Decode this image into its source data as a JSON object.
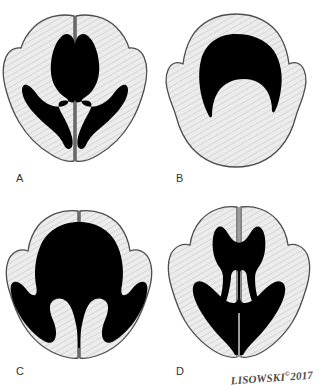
{
  "figure": {
    "background_color": "#ffffff",
    "brain_fill_color": "#e8e8e8",
    "brain_outline_color": "#4d4d4d",
    "ventricle_color": "#000000",
    "hatch_color": "#b8b8b8",
    "panel_count": 4
  },
  "panels": [
    {
      "label": "A",
      "name": "normal-ventricles",
      "description": "Normal paired lateral ventricles, butterfly configuration with frontal and occipital horns",
      "ventricle_pattern": "paired-slender-butterfly"
    },
    {
      "label": "B",
      "name": "single-crescent-ventricle",
      "description": "Single midline crescent-shaped monoventricle, absent interhemispheric fissure",
      "ventricle_pattern": "crescent-monoventricle"
    },
    {
      "label": "C",
      "name": "fused-dilated-ventricles",
      "description": "Large fused dilated ventricular cavity with partial posterior separation",
      "ventricle_pattern": "fused-dilated"
    },
    {
      "label": "D",
      "name": "dilated-paired-ventricles",
      "description": "Dilated paired ventricles with communicating anterior body and splayed horns",
      "ventricle_pattern": "dilated-paired"
    }
  ],
  "signature": {
    "artist": "LISOWSKI",
    "copyright_symbol": "©",
    "year": "2017"
  }
}
